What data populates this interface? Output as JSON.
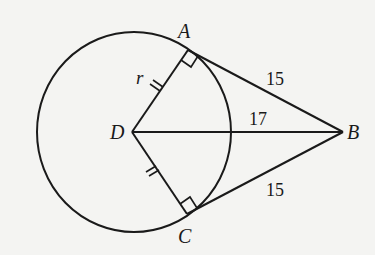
{
  "diagram": {
    "type": "geometry",
    "colors": {
      "background": "#f4f4f2",
      "stroke": "#1a1a1a"
    },
    "points": {
      "A": {
        "label": "A"
      },
      "B": {
        "label": "B"
      },
      "C": {
        "label": "C"
      },
      "D": {
        "label": "D"
      }
    },
    "segments": {
      "AB": {
        "label": "15"
      },
      "CB": {
        "label": "15"
      },
      "DB": {
        "label": "17"
      },
      "DA": {
        "label": "r",
        "tick_marks": 2
      },
      "DC": {
        "label": "",
        "tick_marks": 2
      }
    },
    "right_angles": [
      "A",
      "C"
    ]
  }
}
